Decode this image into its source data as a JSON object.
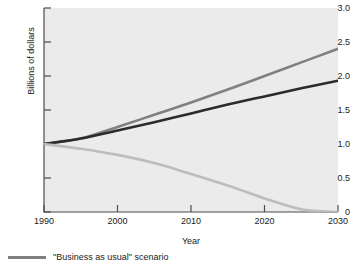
{
  "chart_data": {
    "type": "line",
    "title": "",
    "subtitle": "",
    "xlabel": "Year",
    "ylabel": "Billions of dollars",
    "xlim": [
      1990,
      2030
    ],
    "ylim": [
      0,
      3.0
    ],
    "grid": false,
    "legend_position": "below-left",
    "x_ticks": [
      "1990",
      "2000",
      "2010",
      "2020",
      "2030"
    ],
    "x_tick_values": [
      1990,
      2000,
      2010,
      2020,
      2030
    ],
    "y_ticks": [
      "0",
      "0.5",
      "1.0",
      "1.5",
      "2.0",
      "2.5",
      "3.0"
    ],
    "y_tick_values": [
      0,
      0.5,
      1.0,
      1.5,
      2.0,
      2.5,
      3.0
    ],
    "plot_background": "#ebebeb",
    "x": [
      1990,
      1995,
      2000,
      2005,
      2010,
      2015,
      2020,
      2025,
      2030
    ],
    "series": [
      {
        "name": "upper-growth-scenario",
        "color": "#808080",
        "width": 2.6,
        "values": [
          1.0,
          1.08,
          1.25,
          1.43,
          1.61,
          1.8,
          2.0,
          2.2,
          2.4
        ]
      },
      {
        "name": "business-as-usual-scenario",
        "color": "#2b2b2b",
        "width": 2.6,
        "values": [
          1.0,
          1.08,
          1.2,
          1.32,
          1.45,
          1.58,
          1.7,
          1.82,
          1.93
        ]
      },
      {
        "name": "declining-scenario",
        "color": "#bdbdbd",
        "width": 2.6,
        "values": [
          1.0,
          0.93,
          0.84,
          0.72,
          0.56,
          0.39,
          0.2,
          0.04,
          0.0
        ]
      }
    ],
    "legend": [
      {
        "label": "\"Business as usual\" scenario",
        "color": "#7f7f7f"
      }
    ]
  }
}
